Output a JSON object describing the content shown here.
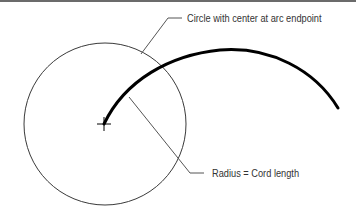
{
  "diagram": {
    "labels": {
      "circle_label": "Circle with center at arc endpoint",
      "radius_label": "Radius = Cord length"
    },
    "elements": {
      "circle": {
        "cx": 105,
        "cy": 124,
        "r": 81,
        "stroke": "#3a3a3a"
      },
      "arc": {
        "start": [
          104,
          124
        ],
        "end": [
          338,
          108
        ],
        "stroke": "#000000"
      },
      "center_mark": {
        "x": 104,
        "y": 124
      }
    },
    "colors": {
      "background": "#ffffff",
      "top_rule": "#6b6b6b",
      "leader": "#555555",
      "text": "#333333"
    }
  }
}
